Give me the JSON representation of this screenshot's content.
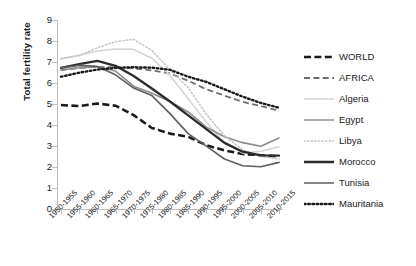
{
  "chart_data": {
    "type": "line",
    "title": "",
    "xlabel": "",
    "ylabel": "Total fertility rate",
    "ylim": [
      0,
      9
    ],
    "yticks": [
      0,
      1,
      2,
      3,
      4,
      5,
      6,
      7,
      8,
      9
    ],
    "grid": false,
    "legend_position": "right",
    "categories": [
      "1950-1955",
      "1955-1960",
      "1960-1965",
      "1965-1970",
      "1970-1975",
      "1975-1980",
      "1980-1985",
      "1985-1990",
      "1990-1995",
      "1995-2000",
      "2000-2005",
      "2005-2010",
      "2010-2015"
    ],
    "series": [
      {
        "name": "WORLD",
        "style": "dashed-thick",
        "color": "#1a1a1a",
        "values": [
          4.95,
          4.9,
          5.02,
          4.92,
          4.47,
          3.86,
          3.59,
          3.44,
          3.04,
          2.79,
          2.62,
          2.56,
          2.51
        ]
      },
      {
        "name": "AFRICA",
        "style": "dashed",
        "color": "#6e6e6e",
        "values": [
          6.61,
          6.72,
          6.77,
          6.74,
          6.7,
          6.6,
          6.46,
          6.11,
          5.7,
          5.4,
          5.1,
          4.9,
          4.68
        ]
      },
      {
        "name": "Algeria",
        "style": "solid",
        "color": "#d4d4d4",
        "values": [
          7.15,
          7.32,
          7.52,
          7.62,
          7.6,
          7.18,
          6.36,
          5.26,
          4.13,
          3.15,
          2.66,
          2.75,
          2.96
        ]
      },
      {
        "name": "Egypt",
        "style": "solid",
        "color": "#8c8c8c",
        "values": [
          6.62,
          6.73,
          6.77,
          6.57,
          5.85,
          5.51,
          5.12,
          4.62,
          3.9,
          3.44,
          3.16,
          2.99,
          3.38
        ]
      },
      {
        "name": "Libya",
        "style": "dotted",
        "color": "#c4c4c4",
        "values": [
          7.17,
          7.3,
          7.68,
          7.97,
          8.08,
          7.55,
          6.63,
          5.78,
          4.51,
          3.48,
          2.83,
          2.5,
          2.38
        ]
      },
      {
        "name": "Morocco",
        "style": "solid-thick",
        "color": "#2b2b2b",
        "values": [
          6.72,
          6.9,
          7.05,
          6.82,
          6.33,
          5.74,
          5.12,
          4.46,
          3.8,
          3.15,
          2.73,
          2.55,
          2.54
        ]
      },
      {
        "name": "Tunisia",
        "style": "solid",
        "color": "#5e5e5e",
        "values": [
          6.72,
          6.84,
          6.79,
          6.39,
          5.76,
          5.4,
          4.54,
          3.59,
          2.99,
          2.38,
          2.06,
          2.01,
          2.22
        ]
      },
      {
        "name": "Mauritania",
        "style": "dotted-thick",
        "color": "#1a1a1a",
        "values": [
          6.3,
          6.49,
          6.64,
          6.72,
          6.75,
          6.73,
          6.63,
          6.3,
          6.05,
          5.7,
          5.35,
          5.05,
          4.82
        ]
      }
    ]
  },
  "axis": {
    "y_title": "Total fertility rate"
  }
}
